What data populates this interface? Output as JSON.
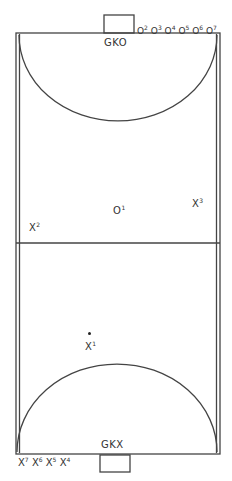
{
  "diagram": {
    "type": "handball-court",
    "line_color": "#444444",
    "top_goalkeeper": "GKO",
    "bottom_goalkeeper": "GKX",
    "top_bench": [
      {
        "base": "O",
        "num": "2"
      },
      {
        "base": "O",
        "num": "3"
      },
      {
        "base": "O",
        "num": "4"
      },
      {
        "base": "O",
        "num": "5"
      },
      {
        "base": "O",
        "num": "6"
      },
      {
        "base": "O",
        "num": "7"
      }
    ],
    "bottom_bench": [
      {
        "base": "X",
        "num": "7"
      },
      {
        "base": "X",
        "num": "6"
      },
      {
        "base": "X",
        "num": "5"
      },
      {
        "base": "X",
        "num": "4"
      }
    ],
    "court_players": {
      "o1": {
        "base": "O",
        "num": "1"
      },
      "x1": {
        "base": "X",
        "num": "1"
      },
      "x2": {
        "base": "X",
        "num": "2"
      },
      "x3": {
        "base": "X",
        "num": "3"
      }
    },
    "ball": "dot"
  }
}
